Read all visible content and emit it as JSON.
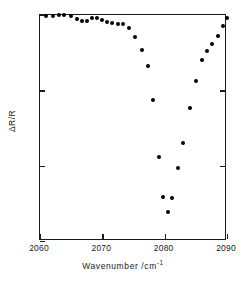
{
  "chart_data": {
    "type": "scatter",
    "title": "",
    "xlabel": "Wavenumber  /cm",
    "xlabel_exponent": "-1",
    "ylabel": "ΔR/R",
    "xlim": [
      2060,
      2090
    ],
    "ylim": [
      0,
      0.15
    ],
    "y_inverted": true,
    "grid": false,
    "legend": null,
    "xticks": [
      "2060",
      "2070",
      "2080",
      "2090"
    ],
    "xtick_values": [
      2060,
      2070,
      2080,
      2090
    ],
    "yticks": [
      "0",
      "0.05",
      "0.10",
      "0.15"
    ],
    "ytick_values": [
      0,
      0.05,
      0.1,
      0.15
    ],
    "series_name": "reflectance change",
    "marker": "filled-circle",
    "marker_color": "#000000",
    "points": [
      {
        "x": 2061.0,
        "y": 0.0005
      },
      {
        "x": 2062.1,
        "y": 0.0005
      },
      {
        "x": 2063.0,
        "y": 0.0
      },
      {
        "x": 2063.9,
        "y": 0.0
      },
      {
        "x": 2064.9,
        "y": 0.0005
      },
      {
        "x": 2065.9,
        "y": 0.0026
      },
      {
        "x": 2066.8,
        "y": 0.004
      },
      {
        "x": 2067.6,
        "y": 0.0037
      },
      {
        "x": 2068.3,
        "y": 0.0022
      },
      {
        "x": 2069.2,
        "y": 0.0019
      },
      {
        "x": 2070.0,
        "y": 0.0031
      },
      {
        "x": 2070.8,
        "y": 0.0048
      },
      {
        "x": 2071.6,
        "y": 0.0055
      },
      {
        "x": 2072.5,
        "y": 0.0059
      },
      {
        "x": 2073.3,
        "y": 0.0059
      },
      {
        "x": 2074.2,
        "y": 0.0088
      },
      {
        "x": 2075.3,
        "y": 0.0148
      },
      {
        "x": 2076.4,
        "y": 0.0233
      },
      {
        "x": 2077.3,
        "y": 0.0338
      },
      {
        "x": 2078.2,
        "y": 0.0563
      },
      {
        "x": 2079.1,
        "y": 0.0944
      },
      {
        "x": 2079.8,
        "y": 0.1205
      },
      {
        "x": 2080.5,
        "y": 0.1308
      },
      {
        "x": 2081.2,
        "y": 0.1216
      },
      {
        "x": 2082.1,
        "y": 0.1017
      },
      {
        "x": 2083.0,
        "y": 0.0848
      },
      {
        "x": 2084.0,
        "y": 0.0619
      },
      {
        "x": 2085.0,
        "y": 0.0437
      },
      {
        "x": 2086.0,
        "y": 0.03
      },
      {
        "x": 2086.8,
        "y": 0.0241
      },
      {
        "x": 2087.6,
        "y": 0.019
      },
      {
        "x": 2088.5,
        "y": 0.0138
      },
      {
        "x": 2089.3,
        "y": 0.0073
      },
      {
        "x": 2090.0,
        "y": 0.0022
      }
    ]
  }
}
